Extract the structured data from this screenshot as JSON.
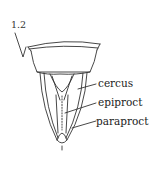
{
  "figure": {
    "number": "1.2",
    "labels": [
      {
        "id": "cercus",
        "text": "cercus"
      },
      {
        "id": "epiproct",
        "text": "epiproct"
      },
      {
        "id": "paraproct",
        "text": "paraproct"
      }
    ]
  },
  "colors": {
    "line": "#333333",
    "background": "#ffffff"
  }
}
